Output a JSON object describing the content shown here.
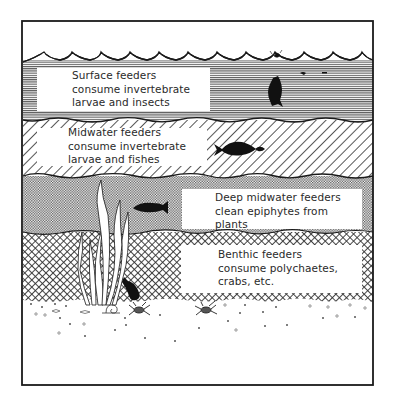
{
  "diagram": {
    "type": "feeding-zones-cross-section",
    "zones": [
      {
        "id": "surface",
        "pattern": "horizontal-lines",
        "lines": [
          "Surface feeders",
          "consume invertebrate",
          "larvae and insects"
        ]
      },
      {
        "id": "midwater",
        "pattern": "diagonal-hatch",
        "lines": [
          "Midwater feeders",
          "consume invertebrate",
          "larvae and fishes"
        ]
      },
      {
        "id": "deep-midwater",
        "pattern": "fine-checker",
        "lines": [
          "Deep midwater feeders",
          "clean epiphytes from",
          "plants"
        ]
      },
      {
        "id": "benthic",
        "pattern": "crosshatch",
        "lines": [
          "Benthic feeders",
          "consume polychaetes,",
          "crabs, etc."
        ]
      }
    ],
    "elements": [
      "surface-fish",
      "insect",
      "larvae",
      "midwater-fish",
      "prey-fish",
      "deep-fish",
      "seagrass",
      "benthic-fish",
      "snail",
      "crab-1",
      "crab-2",
      "sediment"
    ],
    "colors": {
      "ink": "#1a1a1a",
      "paper": "#ffffff"
    }
  }
}
